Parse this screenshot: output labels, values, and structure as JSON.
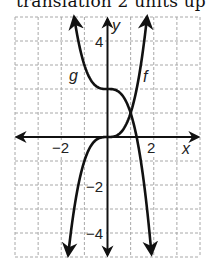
{
  "caption": "translation 2 units up",
  "graph": {
    "x_axis_label": "x",
    "y_axis_label": "y",
    "x_tick_labels": [
      {
        "value": -2,
        "text": "−2"
      },
      {
        "value": 2,
        "text": "2"
      }
    ],
    "y_tick_labels": [
      {
        "value": 4,
        "text": "4"
      },
      {
        "value": -2,
        "text": "−2"
      },
      {
        "value": -4,
        "text": "−4"
      }
    ],
    "curve_labels": {
      "f": "f",
      "g": "g"
    },
    "grid": {
      "xmin": -4,
      "xmax": 4,
      "ymin": -5,
      "ymax": 5,
      "step": 1,
      "style": "dashed",
      "color": "#a8a8a8"
    },
    "curve_color": "#111111"
  },
  "chart_data": {
    "type": "line",
    "title": "translation 2 units up",
    "xlabel": "x",
    "ylabel": "y",
    "xlim": [
      -4,
      4
    ],
    "ylim": [
      -5,
      5
    ],
    "grid": true,
    "series": [
      {
        "name": "f",
        "formula": "f(x) = x^3",
        "x": [
          -1.7,
          -1.5,
          -1,
          -0.5,
          0,
          0.5,
          1,
          1.5,
          1.71
        ],
        "y": [
          -4.91,
          -3.38,
          -1,
          -0.13,
          0,
          0.13,
          1,
          3.38,
          5
        ]
      },
      {
        "name": "g",
        "formula": "g(x) = -x^3 + 2",
        "x": [
          -1.44,
          -1,
          -0.5,
          0,
          0.5,
          1,
          1.5,
          1.9
        ],
        "y": [
          5,
          3,
          2.13,
          2,
          1.88,
          1,
          -1.38,
          -4.86
        ]
      }
    ],
    "annotations": [
      {
        "text": "intersection",
        "x": 1,
        "y": 1
      }
    ]
  }
}
